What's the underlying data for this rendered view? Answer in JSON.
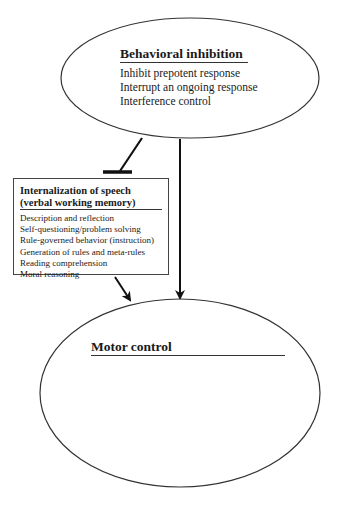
{
  "diagram": {
    "behavioral_inhibition": {
      "title": "Behavioral inhibition",
      "items": [
        "Inhibit prepotent response",
        "Interrupt an ongoing response",
        "Interference control"
      ]
    },
    "internalization_of_speech": {
      "title_line1": "Internalization of speech",
      "title_line2": "(verbal working memory)",
      "items": [
        "Description and reflection",
        "Self-questioning/problem solving",
        "Rule-governed behavior (instruction)",
        "Generation of rules and meta-rules",
        "Reading comprehension",
        "Moral reasoning"
      ]
    },
    "motor_control": {
      "title": "Motor control"
    },
    "edges": [
      {
        "from": "Behavioral inhibition",
        "to": "Internalization of speech",
        "type": "inhibition"
      },
      {
        "from": "Behavioral inhibition",
        "to": "Motor control",
        "type": "arrow"
      },
      {
        "from": "Internalization of speech",
        "to": "Motor control",
        "type": "arrow"
      }
    ]
  }
}
